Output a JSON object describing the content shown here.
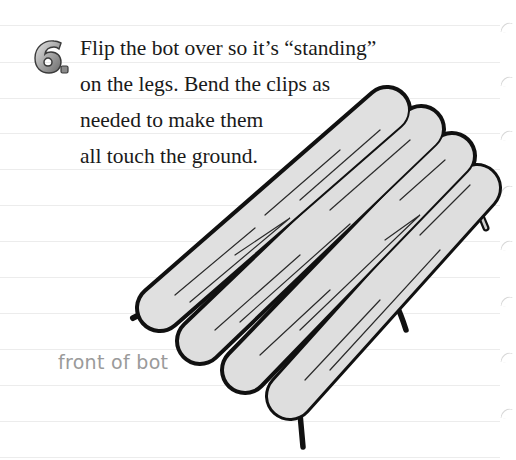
{
  "step": {
    "number": "6",
    "badge_label": "6.",
    "instruction_lines": [
      "Flip the bot over so it’s “standing”",
      "on the legs. Bend the clips as",
      "needed to make them",
      "all touch the ground."
    ]
  },
  "illustration": {
    "subject": "craft-stick bot standing on paper-clip legs",
    "stick_count": 4,
    "label": "front of bot"
  },
  "colors": {
    "text": "#1a1a1a",
    "label": "#9a9a9a",
    "stick_fill": "#dedede",
    "outline": "#111111",
    "rule": "#ececec"
  }
}
